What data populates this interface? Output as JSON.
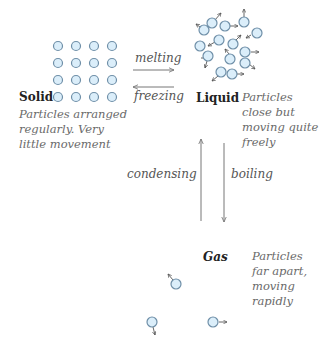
{
  "colors": {
    "particle_fill": "#dbeefa",
    "particle_stroke": "#6f8fa8",
    "arrow": "#777777",
    "state_label": "#222222",
    "description": "#6a6a6a"
  },
  "states": {
    "solid": {
      "label": "Solid",
      "description": "Particles arranged regularly. Very little movement"
    },
    "liquid": {
      "label": "Liquid",
      "description": "Particles close but moving quite freely"
    },
    "gas": {
      "label": "Gas",
      "description": "Particles far apart, moving rapidly"
    }
  },
  "processes": {
    "melting": "melting",
    "freezing": "freezing",
    "condensing": "condensing",
    "boiling": "boiling"
  },
  "icons": {
    "particle": "circle",
    "motion_arrow": "small-arrow"
  }
}
